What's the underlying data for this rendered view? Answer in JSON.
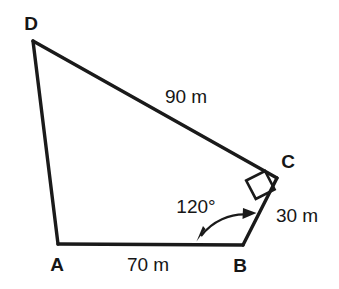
{
  "figure": {
    "kind": "quadrilateral-survey-diagram",
    "background_color": "#ffffff",
    "stroke_color": "#1a1a1a",
    "vertices": [
      {
        "name": "D",
        "label": "D",
        "x": 33,
        "y": 41,
        "label_x": 31,
        "label_y": 30
      },
      {
        "name": "C",
        "label": "C",
        "x": 277,
        "y": 178,
        "label_x": 288,
        "label_y": 168
      },
      {
        "name": "B",
        "label": "B",
        "x": 243,
        "y": 245,
        "label_x": 240,
        "label_y": 272
      },
      {
        "name": "A",
        "label": "A",
        "x": 58,
        "y": 244,
        "label_x": 57,
        "label_y": 271
      }
    ],
    "edges": [
      {
        "name": "edge-DC",
        "from": "D",
        "to": "C",
        "length_label": "90 m"
      },
      {
        "name": "edge-CB",
        "from": "C",
        "to": "B",
        "length_label": "30 m"
      },
      {
        "name": "edge-BA",
        "from": "B",
        "to": "A",
        "length_label": "70 m"
      },
      {
        "name": "edge-AD",
        "from": "A",
        "to": "D",
        "length_label": ""
      }
    ],
    "length_labels": [
      {
        "name": "length-label-dc",
        "text": "90 m",
        "x": 186,
        "y": 103
      },
      {
        "name": "length-label-cb",
        "text": "30 m",
        "x": 297,
        "y": 222
      },
      {
        "name": "length-label-ba",
        "text": "70 m",
        "x": 148,
        "y": 271
      }
    ],
    "angles": [
      {
        "name": "angle-at-B",
        "text": "120°",
        "vertex": "B",
        "label_x": 196,
        "label_y": 213,
        "marker": "double-headed-arc"
      },
      {
        "name": "right-angle-at-C",
        "text": "",
        "vertex": "C",
        "marker": "square"
      }
    ]
  }
}
